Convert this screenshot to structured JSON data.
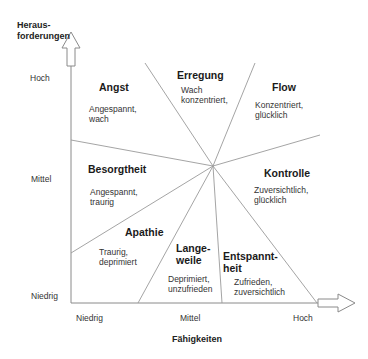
{
  "y_axis": {
    "title_line1": "Heraus-",
    "title_line2": "forderungen",
    "ticks": [
      "Hoch",
      "Mittel",
      "Niedrig"
    ]
  },
  "x_axis": {
    "title": "Fähigkeiten",
    "ticks": [
      "Niedrig",
      "Mittel",
      "Hoch"
    ]
  },
  "zones": [
    {
      "title": "Angst",
      "desc1": "Angespannt,",
      "desc2": "wach"
    },
    {
      "title": "Erregung",
      "desc1": "Wach",
      "desc2": "konzentriert,"
    },
    {
      "title": "Flow",
      "desc1": "Konzentriert,",
      "desc2": "glücklich"
    },
    {
      "title": "Besorgtheit",
      "desc1": "Angespannt,",
      "desc2": "traurig"
    },
    {
      "title": "Kontrolle",
      "desc1": "Zuversichtlich,",
      "desc2": "glücklich"
    },
    {
      "title": "Apathie",
      "desc1": "Traurig,",
      "desc2": "deprimiert"
    },
    {
      "title1": "Lange-",
      "title2": "weile",
      "desc1": "Deprimiert,",
      "desc2": "unzufrieden"
    },
    {
      "title1": "Entspannt-",
      "title2": "heit",
      "desc1": "Zufrieden,",
      "desc2": "zuversichtlich"
    }
  ],
  "colors": {
    "line": "#9a9a9a",
    "axis": "#8a8a8a",
    "text": "#222222"
  }
}
